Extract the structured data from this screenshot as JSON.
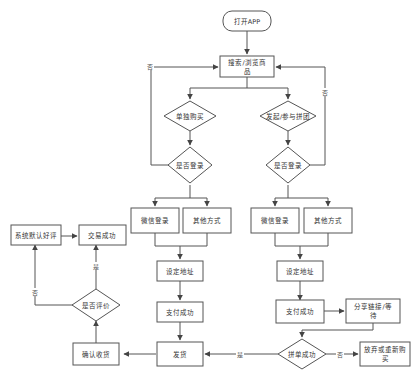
{
  "diagram": {
    "type": "flowchart",
    "nodes": {
      "start": "打开APP",
      "browse_line1": "搜索/浏览商",
      "browse_line2": "品",
      "solo_buy": "单独购买",
      "group_buy": "发起/参与拼团",
      "login_check_left": "是否登录",
      "login_check_right": "是否登录",
      "wechat_login_left": "微信登录",
      "other_login_left": "其他方式",
      "wechat_login_right": "微信登录",
      "other_login_right": "其他方式",
      "address_left": "设定地址",
      "address_right": "设定地址",
      "pay_left": "支付成功",
      "pay_right": "支付成功",
      "share_line1": "分享链接/等",
      "share_line2": "待",
      "group_success": "拼单成功",
      "give_up_line1": "放弃或重新购",
      "give_up_line2": "买",
      "ship": "发货",
      "confirm_receipt": "确认收货",
      "review_check": "是否评价",
      "default_review": "系统默认好评",
      "deal_done": "交易成功"
    },
    "edge_labels": {
      "no_left_login": "否",
      "no_right_login": "否",
      "yes_group": "是",
      "no_group": "否",
      "yes_review": "是",
      "no_review": "否"
    }
  }
}
